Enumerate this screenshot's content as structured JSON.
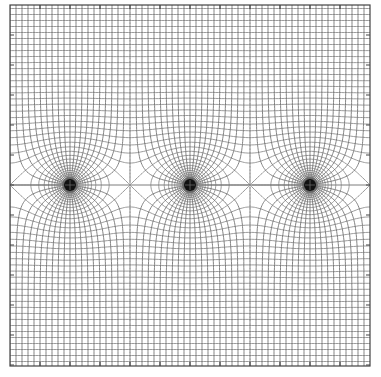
{
  "figure": {
    "title": "Field lines and equipotentials of a periodic row of point charges",
    "width": 381,
    "height": 377,
    "plot_box": {
      "x0": 10,
      "y0": 5,
      "x1": 370,
      "y1": 366
    },
    "center_y": 185,
    "period_px": 120,
    "charges": [
      {
        "label": "charge-1",
        "x": 70,
        "y": 185,
        "radius": 6
      },
      {
        "label": "charge-2",
        "x": 190,
        "y": 185,
        "radius": 6
      },
      {
        "label": "charge-3",
        "x": 310,
        "y": 185,
        "radius": 6
      }
    ],
    "field_line_step": 0.15707963,
    "equipotential_step": 0.15707963,
    "tick_spacing_px": 30,
    "tick_length_px": 4,
    "colors": {
      "background": "#ffffff",
      "field_line": "#6e6e6e",
      "equipotential": "#8a8a8a",
      "frame": "#444444",
      "charge": "#111111",
      "midline": "#bdbdbd"
    }
  }
}
